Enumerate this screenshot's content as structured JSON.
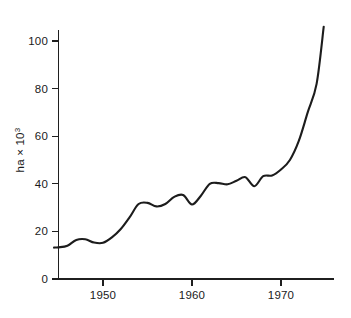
{
  "chart_data": {
    "type": "line",
    "title": "",
    "subtitle": "",
    "xlabel": "",
    "ylabel": "ha × 10³",
    "ylabel_base": "ha × 10",
    "ylabel_exponent": "3",
    "xlim": [
      1944,
      1975
    ],
    "ylim": [
      0,
      110
    ],
    "grid": false,
    "legend": null,
    "legend_position": "none",
    "y_ticks": [
      0,
      20,
      40,
      60,
      80,
      100
    ],
    "y_tick_labels": [
      "0",
      "20",
      "40",
      "60",
      "80",
      "100"
    ],
    "x_ticks": [
      1950,
      1960,
      1970
    ],
    "x_tick_labels": [
      "1950",
      "1960",
      "1970"
    ],
    "x_minor_ticks": [],
    "line_color": "#1c1c1c",
    "axis_color": "#1f1f1f",
    "background_color": "#ffffff",
    "series": [
      {
        "name": "area",
        "x": [
          1944.5,
          1945,
          1946,
          1947,
          1948,
          1949,
          1950,
          1951,
          1952,
          1953,
          1954,
          1955,
          1956,
          1957,
          1958,
          1959,
          1960,
          1961,
          1962,
          1963,
          1964,
          1965,
          1966,
          1967,
          1968,
          1969,
          1970,
          1971,
          1972,
          1973,
          1974,
          1974.8
        ],
        "y": [
          13.2,
          13.3,
          14.0,
          16.4,
          16.7,
          15.3,
          15.2,
          17.5,
          21.0,
          26.0,
          31.5,
          32.0,
          30.5,
          31.5,
          34.5,
          35.3,
          31.3,
          35.0,
          40.0,
          40.3,
          39.8,
          41.3,
          42.8,
          39.0,
          43.2,
          43.5,
          46.0,
          50.0,
          58.0,
          70.0,
          82.0,
          106.0
        ]
      }
    ],
    "annotations": []
  }
}
